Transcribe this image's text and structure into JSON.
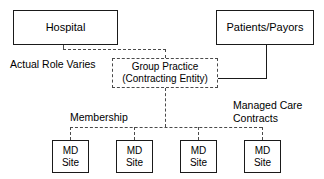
{
  "diagram": {
    "nodes": {
      "hospital": {
        "label": "Hospital"
      },
      "patients_payors": {
        "label": "Patients/Payors"
      },
      "group_practice": {
        "line1": "Group Practice",
        "line2": "(Contracting Entity)"
      },
      "md_site_1": {
        "line1": "MD",
        "line2": "Site"
      },
      "md_site_2": {
        "line1": "MD",
        "line2": "Site"
      },
      "md_site_3": {
        "line1": "MD",
        "line2": "Site"
      },
      "md_site_4": {
        "line1": "MD",
        "line2": "Site"
      }
    },
    "labels": {
      "actual_role_varies": "Actual Role Varies",
      "membership": "Membership",
      "managed_care_contracts_line1": "Managed Care",
      "managed_care_contracts_line2": "Contracts"
    },
    "colors": {
      "solid_stroke": "#1a1a1a",
      "dashed_stroke": "#4a4a4a",
      "background": "#ffffff",
      "text": "#000000"
    }
  }
}
